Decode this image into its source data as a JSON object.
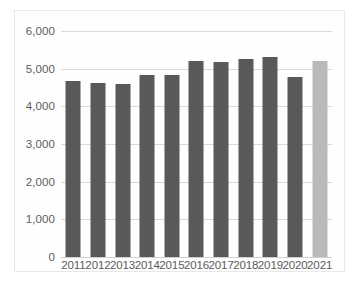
{
  "chart_data": {
    "type": "bar",
    "title": "",
    "subtitle": "",
    "xlabel": "",
    "ylabel": "",
    "categories": [
      "2011",
      "2012",
      "2013",
      "2014",
      "2015",
      "2016",
      "2017",
      "2018",
      "2019",
      "2020",
      "2021"
    ],
    "values": [
      4670,
      4620,
      4590,
      4820,
      4840,
      5200,
      5170,
      5250,
      5310,
      4790,
      5210
    ],
    "ylim": [
      0,
      6000
    ],
    "ytick_values": [
      0,
      1000,
      2000,
      3000,
      4000,
      5000,
      6000
    ],
    "ytick_labels": [
      "0",
      "1,000",
      "2,000",
      "3,000",
      "4,000",
      "5,000",
      "6,000"
    ],
    "grid": true,
    "legend": false,
    "legend_position": "none",
    "bar_colors": [
      "#595959",
      "#595959",
      "#595959",
      "#595959",
      "#595959",
      "#595959",
      "#595959",
      "#595959",
      "#595959",
      "#595959",
      "#b9b9b9"
    ],
    "annotations": []
  },
  "style": {
    "series_color": "#595959",
    "highlight_color": "#b9b9b9",
    "gridline_color": "#d9d9d9",
    "axis_text_color": "#5c5c5c",
    "plot_background": "#fefefe",
    "frame_border_color": "#e8e8e8"
  }
}
